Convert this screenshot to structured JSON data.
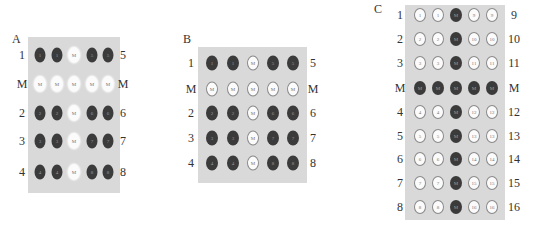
{
  "panels": [
    {
      "id": "A",
      "letter": "A",
      "left_labels": [
        "1",
        "M",
        "2",
        "3",
        "4"
      ],
      "right_labels": [
        "5",
        "M",
        "6",
        "7",
        "8"
      ],
      "wells": [
        [
          {
            "text": "1",
            "tone": "dark"
          },
          {
            "text": "1",
            "tone": "dark"
          },
          {
            "text": "M",
            "tone": "light"
          },
          {
            "text": "5",
            "tone": "dark"
          },
          {
            "text": "5",
            "tone": "dark"
          }
        ],
        [
          {
            "text": "M",
            "tone": "light"
          },
          {
            "text": "M",
            "tone": "light"
          },
          {
            "text": "M",
            "tone": "light"
          },
          {
            "text": "M",
            "tone": "light"
          },
          {
            "text": "M",
            "tone": "light"
          }
        ],
        [
          {
            "text": "2",
            "tone": "dark"
          },
          {
            "text": "2",
            "tone": "dark"
          },
          {
            "text": "M",
            "tone": "light"
          },
          {
            "text": "6",
            "tone": "dark"
          },
          {
            "text": "6",
            "tone": "dark"
          }
        ],
        [
          {
            "text": "3",
            "tone": "dark"
          },
          {
            "text": "3",
            "tone": "dark"
          },
          {
            "text": "M",
            "tone": "light"
          },
          {
            "text": "7",
            "tone": "dark"
          },
          {
            "text": "7",
            "tone": "dark"
          }
        ],
        [
          {
            "text": "4",
            "tone": "dark"
          },
          {
            "text": "4",
            "tone": "dark"
          },
          {
            "text": "M",
            "tone": "light"
          },
          {
            "text": "8",
            "tone": "dark"
          },
          {
            "text": "8",
            "tone": "dark"
          }
        ]
      ]
    },
    {
      "id": "B",
      "letter": "B",
      "left_labels": [
        "1",
        "M",
        "2",
        "3",
        "4"
      ],
      "right_labels": [
        "5",
        "M",
        "6",
        "7",
        "8"
      ],
      "wells": [
        [
          {
            "text": "1",
            "tone": "dark"
          },
          {
            "text": "1",
            "tone": "dark"
          },
          {
            "text": "M",
            "tone": "light"
          },
          {
            "text": "5",
            "tone": "dark"
          },
          {
            "text": "5",
            "tone": "dark"
          }
        ],
        [
          {
            "text": "M",
            "tone": "light"
          },
          {
            "text": "M",
            "tone": "light"
          },
          {
            "text": "M",
            "tone": "light"
          },
          {
            "text": "M",
            "tone": "light"
          },
          {
            "text": "M",
            "tone": "light"
          }
        ],
        [
          {
            "text": "2",
            "tone": "dark"
          },
          {
            "text": "2",
            "tone": "dark"
          },
          {
            "text": "M",
            "tone": "light"
          },
          {
            "text": "6",
            "tone": "dark"
          },
          {
            "text": "6",
            "tone": "dark"
          }
        ],
        [
          {
            "text": "3",
            "tone": "dark"
          },
          {
            "text": "3",
            "tone": "dark"
          },
          {
            "text": "M",
            "tone": "light"
          },
          {
            "text": "7",
            "tone": "dark"
          },
          {
            "text": "7",
            "tone": "dark"
          }
        ],
        [
          {
            "text": "4",
            "tone": "dark"
          },
          {
            "text": "4",
            "tone": "dark"
          },
          {
            "text": "M",
            "tone": "light"
          },
          {
            "text": "8",
            "tone": "dark"
          },
          {
            "text": "8",
            "tone": "dark"
          }
        ]
      ]
    },
    {
      "id": "C",
      "letter": "C",
      "left_labels": [
        "1",
        "2",
        "3",
        "M",
        "4",
        "5",
        "6",
        "7",
        "8"
      ],
      "right_labels": [
        "9",
        "10",
        "11",
        "M",
        "12",
        "13",
        "14",
        "15",
        "16"
      ],
      "wells": [
        [
          {
            "text": "1",
            "tone": "light"
          },
          {
            "text": "1",
            "tone": "light"
          },
          {
            "text": "M",
            "tone": "dark"
          },
          {
            "text": "9",
            "tone": "light"
          },
          {
            "text": "9",
            "tone": "light"
          }
        ],
        [
          {
            "text": "2",
            "tone": "light"
          },
          {
            "text": "2",
            "tone": "light"
          },
          {
            "text": "M",
            "tone": "dark"
          },
          {
            "text": "10",
            "tone": "light"
          },
          {
            "text": "10",
            "tone": "light"
          }
        ],
        [
          {
            "text": "3",
            "tone": "light"
          },
          {
            "text": "3",
            "tone": "light"
          },
          {
            "text": "M",
            "tone": "dark"
          },
          {
            "text": "11",
            "tone": "light"
          },
          {
            "text": "11",
            "tone": "light"
          }
        ],
        [
          {
            "text": "M",
            "tone": "dark"
          },
          {
            "text": "M",
            "tone": "dark"
          },
          {
            "text": "M",
            "tone": "dark"
          },
          {
            "text": "M",
            "tone": "dark"
          },
          {
            "text": "M",
            "tone": "dark"
          }
        ],
        [
          {
            "text": "4",
            "tone": "light"
          },
          {
            "text": "4",
            "tone": "light"
          },
          {
            "text": "M",
            "tone": "dark"
          },
          {
            "text": "12",
            "tone": "light"
          },
          {
            "text": "12",
            "tone": "light"
          }
        ],
        [
          {
            "text": "5",
            "tone": "light"
          },
          {
            "text": "5",
            "tone": "light"
          },
          {
            "text": "M",
            "tone": "dark"
          },
          {
            "text": "13",
            "tone": "light"
          },
          {
            "text": "13",
            "tone": "light"
          }
        ],
        [
          {
            "text": "6",
            "tone": "light"
          },
          {
            "text": "6",
            "tone": "light"
          },
          {
            "text": "M",
            "tone": "dark"
          },
          {
            "text": "14",
            "tone": "light"
          },
          {
            "text": "14",
            "tone": "light"
          }
        ],
        [
          {
            "text": "7",
            "tone": "light"
          },
          {
            "text": "7",
            "tone": "light"
          },
          {
            "text": "M",
            "tone": "dark"
          },
          {
            "text": "15",
            "tone": "light"
          },
          {
            "text": "15",
            "tone": "light"
          }
        ],
        [
          {
            "text": "8",
            "tone": "light"
          },
          {
            "text": "8",
            "tone": "light"
          },
          {
            "text": "M",
            "tone": "dark"
          },
          {
            "text": "16",
            "tone": "light"
          },
          {
            "text": "16",
            "tone": "light"
          }
        ]
      ]
    }
  ],
  "colors": {
    "plate": "#d9d9d9",
    "dark_well": "#3b3b3b",
    "light_well": "#fbfbfb"
  }
}
